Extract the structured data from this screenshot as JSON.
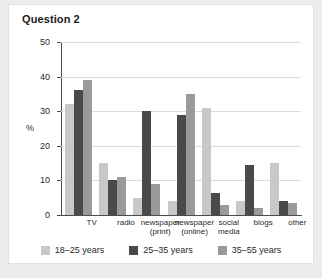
{
  "panel": {
    "title": "Question 2"
  },
  "chart_data": {
    "type": "bar",
    "title": "Question 2",
    "xlabel": "",
    "ylabel": "%",
    "ylim": [
      0,
      50
    ],
    "yticks": [
      0,
      10,
      20,
      30,
      40,
      50
    ],
    "grid": true,
    "legend_position": "bottom",
    "categories": [
      "TV",
      "radio",
      "newspaper (print)",
      "newspaper (online)",
      "social media",
      "blogs",
      "other"
    ],
    "category_lines": [
      [
        "TV"
      ],
      [
        "radio"
      ],
      [
        "newspaper",
        "(print)"
      ],
      [
        "newspaper",
        "(online)"
      ],
      [
        "social",
        "media"
      ],
      [
        "blogs"
      ],
      [
        "other"
      ]
    ],
    "series": [
      {
        "name": "18–25 years",
        "color": "#c8c8c8",
        "values": [
          32,
          15,
          5,
          4,
          31,
          4,
          15
        ]
      },
      {
        "name": "25–35 years",
        "color": "#4a4a4a",
        "values": [
          36,
          10,
          30,
          29,
          6.5,
          14.5,
          4
        ]
      },
      {
        "name": "35–55 years",
        "color": "#9a9a9a",
        "values": [
          39,
          11,
          9,
          35,
          3,
          2,
          3.5
        ]
      }
    ]
  }
}
